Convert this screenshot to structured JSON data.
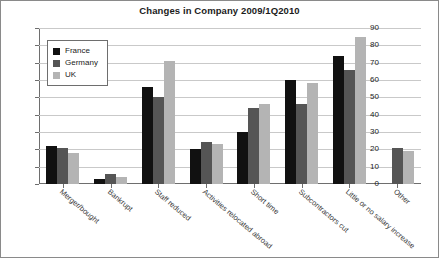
{
  "chart_data": {
    "type": "bar",
    "title": "Changes in Company 2009/1Q2010",
    "xlabel": "",
    "ylabel": "",
    "ylim": [
      0,
      90
    ],
    "ytick_step": 10,
    "yticks": [
      "90",
      "80",
      "70",
      "60",
      "50",
      "40",
      "30",
      "20",
      "10",
      "0"
    ],
    "grid": true,
    "legend_position": "top-left-inside",
    "categories": [
      "Merger/bought",
      "Bankrupt",
      "Staff reduced",
      "Activities relocated abroad",
      "Short time",
      "Subcontractors cut",
      "Little or no salary increase",
      "Other"
    ],
    "series": [
      {
        "name": "France",
        "color": "#111111",
        "values": [
          22,
          3,
          56,
          20,
          30,
          60,
          74,
          0
        ]
      },
      {
        "name": "Germany",
        "color": "#555555",
        "values": [
          21,
          6,
          50,
          24,
          44,
          46,
          66,
          21
        ]
      },
      {
        "name": "UK",
        "color": "#b4b4b4",
        "values": [
          18,
          4,
          71,
          23,
          46,
          58,
          85,
          19
        ]
      }
    ]
  },
  "legend": {
    "items": [
      {
        "label": "France",
        "swatch": "france"
      },
      {
        "label": "Germany",
        "swatch": "germany"
      },
      {
        "label": "UK",
        "swatch": "uk"
      }
    ]
  },
  "colors": {
    "france": "#111111",
    "germany": "#555555",
    "uk": "#b4b4b4",
    "axis": "#6e6e6e",
    "grid": "#c9c9c9",
    "text": "#1b1b1b"
  }
}
